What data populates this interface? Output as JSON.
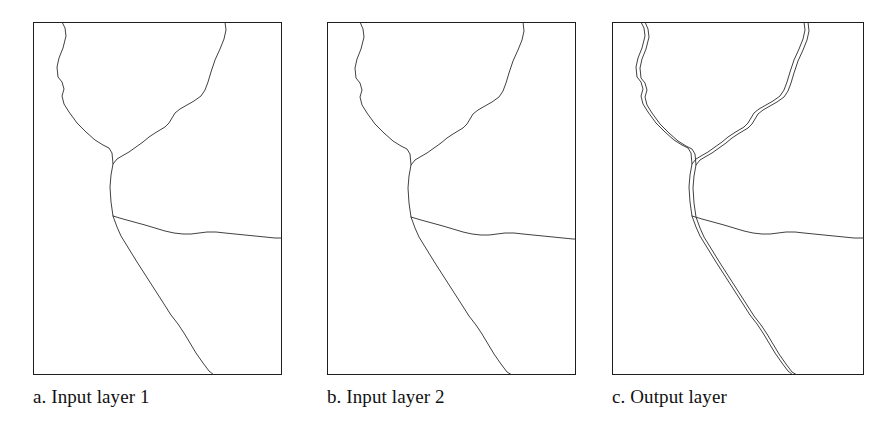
{
  "figure": {
    "width": 895,
    "height": 427,
    "background_color": "#ffffff",
    "line_color": "#2b2b2b",
    "frame_color": "#1d1d1d",
    "text_color": "#111111"
  },
  "panels": [
    {
      "id": "a",
      "caption": "a. Input layer 1",
      "frame": {
        "x": 33,
        "y": 22,
        "width": 249,
        "height": 353
      },
      "lines": {
        "main": "29,0 32,6 33,14 30,26 26,36 24,45 25,55 29,60 31,67 29,74 31,82 36,90 44,101 53,110 62,118 70,123 76,126 79,131 80,142 78,153 77,165 78,180 80,194 84,205 88,214 96,227 104,240 113,254 122,268 131,282 138,293 145,302 151,311 157,321 163,331 170,341 176,349 181,353",
        "branch_upper_right": "192,0 193,8 191,17 187,27 182,38 178,50 175,60 172,68 168,74 161,79 154,83 147,87 142,91 139,96 136,101 132,105 127,108 122,111 116,115 110,120 103,125 96,130 89,134 84,137 80,142",
        "branch_lower_right": "80,194 90,197 101,200 112,203 122,206 132,209 141,211 150,212 158,212 166,211 174,210 183,210 192,211 202,212 212,213 222,214 232,215 242,216 249,216"
      }
    },
    {
      "id": "b",
      "caption": "b. Input layer 2",
      "frame": {
        "x": 327,
        "y": 22,
        "width": 249,
        "height": 353
      },
      "lines": {
        "main": "33,0 36,7 37,15 34,27 30,37 28,46 29,56 33,61 35,68 33,75 35,83 40,91 48,102 57,111 66,119 74,124 80,127 83,132 84,143 82,154 81,166 82,181 84,195 88,206 92,215 100,228 108,241 117,255 126,269 135,283 142,294 149,303 155,312 161,322 167,332 174,342 180,350 185,353",
        "branch_upper_right": "196,0 197,9 195,18 191,28 186,39 182,51 179,61 176,69 172,75 165,80 158,84 151,88 146,92 143,97 140,102 136,106 131,109 126,112 120,116 114,121 107,126 100,131 93,135 88,138 84,143",
        "branch_lower_right": "84,195 94,198 105,201 116,204 126,207 136,210 145,212 154,213 162,213 170,212 178,211 187,211 196,212 206,213 216,214 226,215 236,216 246,217 249,217"
      }
    },
    {
      "id": "c",
      "caption": "c. Output layer",
      "frame": {
        "x": 612,
        "y": 22,
        "width": 252,
        "height": 353
      },
      "lines": {
        "overlay_1_main": "29,0 32,6 33,14 30,26 26,36 24,45 25,55 29,60 31,67 29,74 31,82 36,90 44,101 53,110 62,118 70,123 76,126 79,131 80,142 78,153 77,165 78,180 80,194 84,205 88,214 96,227 104,240 113,254 122,268 131,282 138,293 145,302 151,311 157,321 163,331 170,341 176,349 181,353",
        "overlay_1_branch_upper": "192,0 193,8 191,17 187,27 182,38 178,50 175,60 172,68 168,74 161,79 154,83 147,87 142,91 139,96 136,101 132,105 127,108 122,111 116,115 110,120 103,125 96,130 89,134 84,137 80,142",
        "overlay_1_branch_lower": "80,194 90,197 101,200 112,203 122,206 132,209 141,211 150,212 158,212 166,211 174,210 183,210 192,211 202,212 212,213 222,214 232,215 242,216 252,216",
        "overlay_2_main": "33,0 36,7 37,15 34,27 30,37 28,46 29,56 33,61 35,68 33,75 35,83 40,91 48,102 57,111 66,119 74,124 80,127 83,132 84,143 82,154 81,166 82,181 84,195 88,206 92,215 100,228 108,241 117,255 126,269 135,283 142,294 149,303 155,312 161,322 167,332 174,342 180,350 185,353",
        "overlay_2_branch_upper": "196,0 197,9 195,18 191,28 186,39 182,51 179,61 176,69 172,75 165,80 158,84 151,88 146,92 143,97 140,102 136,106 131,109 126,112 120,116 114,121 107,126 100,131 93,135 88,138 84,143"
      }
    }
  ]
}
